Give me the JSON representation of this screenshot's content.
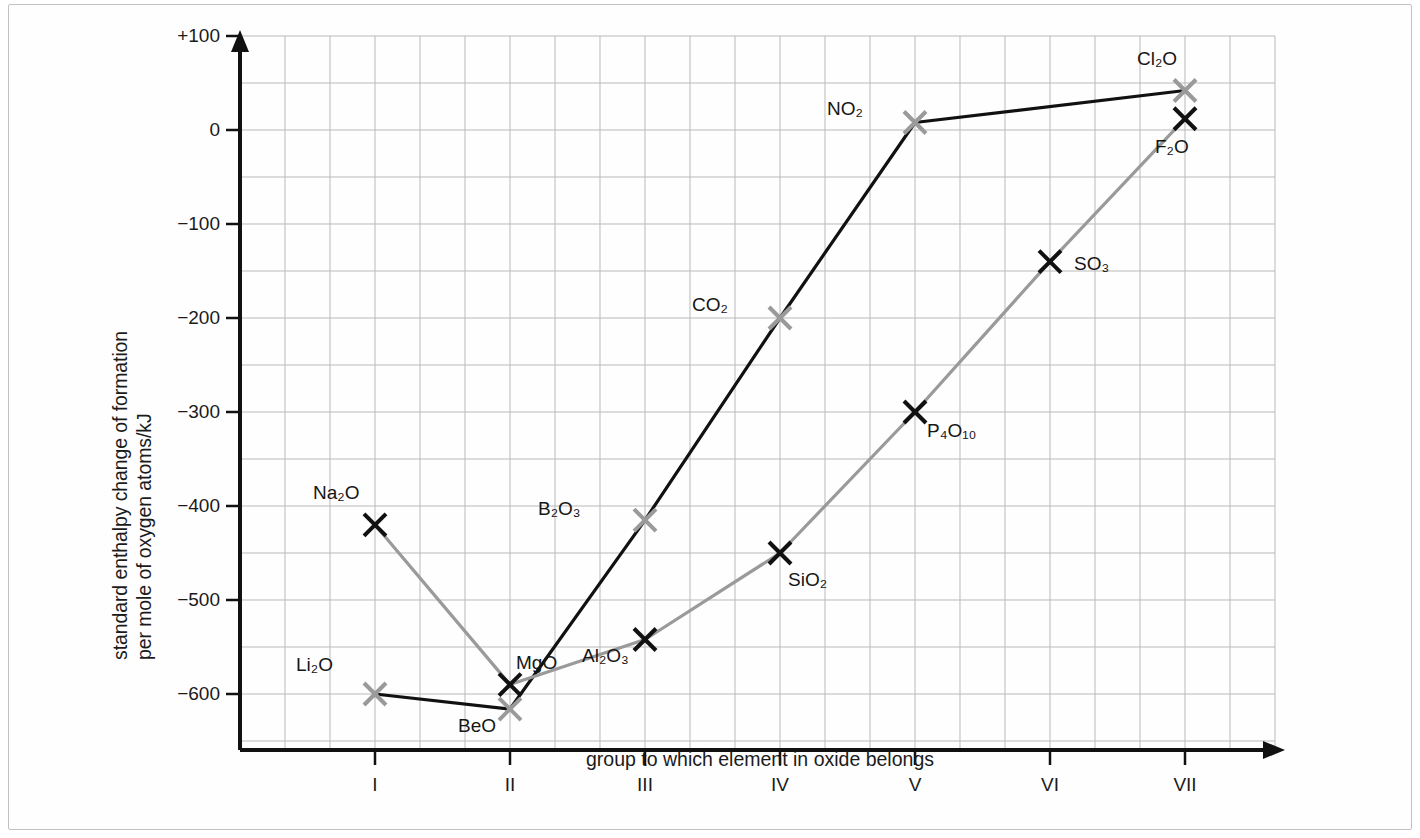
{
  "chart_data": {
    "type": "line",
    "title": "",
    "xlabel": "group to which element in oxide belongs",
    "ylabel_line1": "standard enthalpy change of formation",
    "ylabel_line2": "per mole of oxygen atoms/kJ",
    "x_categories": [
      "I",
      "II",
      "III",
      "IV",
      "V",
      "VI",
      "VII"
    ],
    "y_tick_labels": [
      "+100",
      "0",
      "−100",
      "−200",
      "−300",
      "−400",
      "−500",
      "−600"
    ],
    "y_tick_values": [
      100,
      0,
      -100,
      -200,
      -300,
      -400,
      -500,
      -600
    ],
    "ylim": [
      -650,
      100
    ],
    "xlim": [
      0.5,
      7.6
    ],
    "grid": true,
    "grid_step_y": 50,
    "grid_step_x": 0.3333,
    "legend_position": "none",
    "series": [
      {
        "name": "period-2-oxides",
        "line_color": "#111111",
        "marker_color": "#9a9a9a",
        "points": [
          {
            "label": "Li₂O",
            "formula_text": "Li",
            "sub": "2",
            "tail": "O",
            "group": "I",
            "x": 1,
            "y": -600,
            "label_dx": -52,
            "label_dy": -30
          },
          {
            "label": "BeO",
            "formula_text": "BeO",
            "sub": "",
            "tail": "",
            "group": "II",
            "x": 2,
            "y": -616,
            "label_dx": -24,
            "label_dy": 16
          },
          {
            "label": "B₂O₃",
            "formula_text": "B",
            "sub": "2",
            "tail": "O",
            "group": "III",
            "x": 3,
            "y": -415,
            "label_dx": -74,
            "label_dy": -12
          },
          {
            "label": "CO₂",
            "formula_text": "CO",
            "sub": "2",
            "tail": "",
            "group": "IV",
            "x": 4,
            "y": -200,
            "label_dx": -62,
            "label_dy": -14
          },
          {
            "label": "NO₂",
            "formula_text": "NO",
            "sub": "2",
            "tail": "",
            "group": "V",
            "x": 5,
            "y": 8,
            "label_dx": -62,
            "label_dy": -14
          },
          {
            "label": "Cl₂O",
            "formula_text": "Cl",
            "sub": "2",
            "tail": "O",
            "group": "VII",
            "x": 7,
            "y": 42,
            "label_dx": -18,
            "label_dy": -32
          }
        ]
      },
      {
        "name": "period-3-and-higher-oxides",
        "line_color": "#9a9a9a",
        "marker_color": "#111111",
        "points": [
          {
            "label": "Na₂O",
            "formula_text": "Na",
            "sub": "2",
            "tail": "O",
            "group": "I",
            "x": 1,
            "y": -420,
            "label_dx": -26,
            "label_dy": -32
          },
          {
            "label": "MgO",
            "formula_text": "MgO",
            "sub": "",
            "tail": "",
            "group": "II",
            "x": 2,
            "y": -590,
            "label_dx": 6,
            "label_dy": -22
          },
          {
            "label": "Al₂O₃",
            "formula_text": "Al",
            "sub": "2",
            "tail": "O",
            "group": "III",
            "x": 3,
            "y": -542,
            "label_dx": -26,
            "label_dy": 16
          },
          {
            "label": "SiO₂",
            "formula_text": "SiO",
            "sub": "2",
            "tail": "",
            "group": "IV",
            "x": 4,
            "y": -450,
            "label_dx": 8,
            "label_dy": 26
          },
          {
            "label": "P₄O₁₀",
            "formula_text": "P",
            "sub": "4",
            "tail": "O",
            "group": "V",
            "x": 5,
            "y": -300,
            "label_dx": 12,
            "label_dy": 18
          },
          {
            "label": "SO₃",
            "formula_text": "SO",
            "sub": "3",
            "tail": "",
            "group": "VI",
            "x": 6,
            "y": -140,
            "label_dx": 24,
            "label_dy": 2
          },
          {
            "label": "F₂O",
            "formula_text": "F",
            "sub": "2",
            "tail": "O",
            "group": "VII",
            "x": 7,
            "y": 12,
            "label_dx": -6,
            "label_dy": 28
          }
        ]
      }
    ],
    "colors": {
      "axis": "#111111",
      "grid": "#b9b9b9",
      "black_series": "#111111",
      "gray_series": "#9a9a9a",
      "frame": "#bfc3c6"
    }
  }
}
